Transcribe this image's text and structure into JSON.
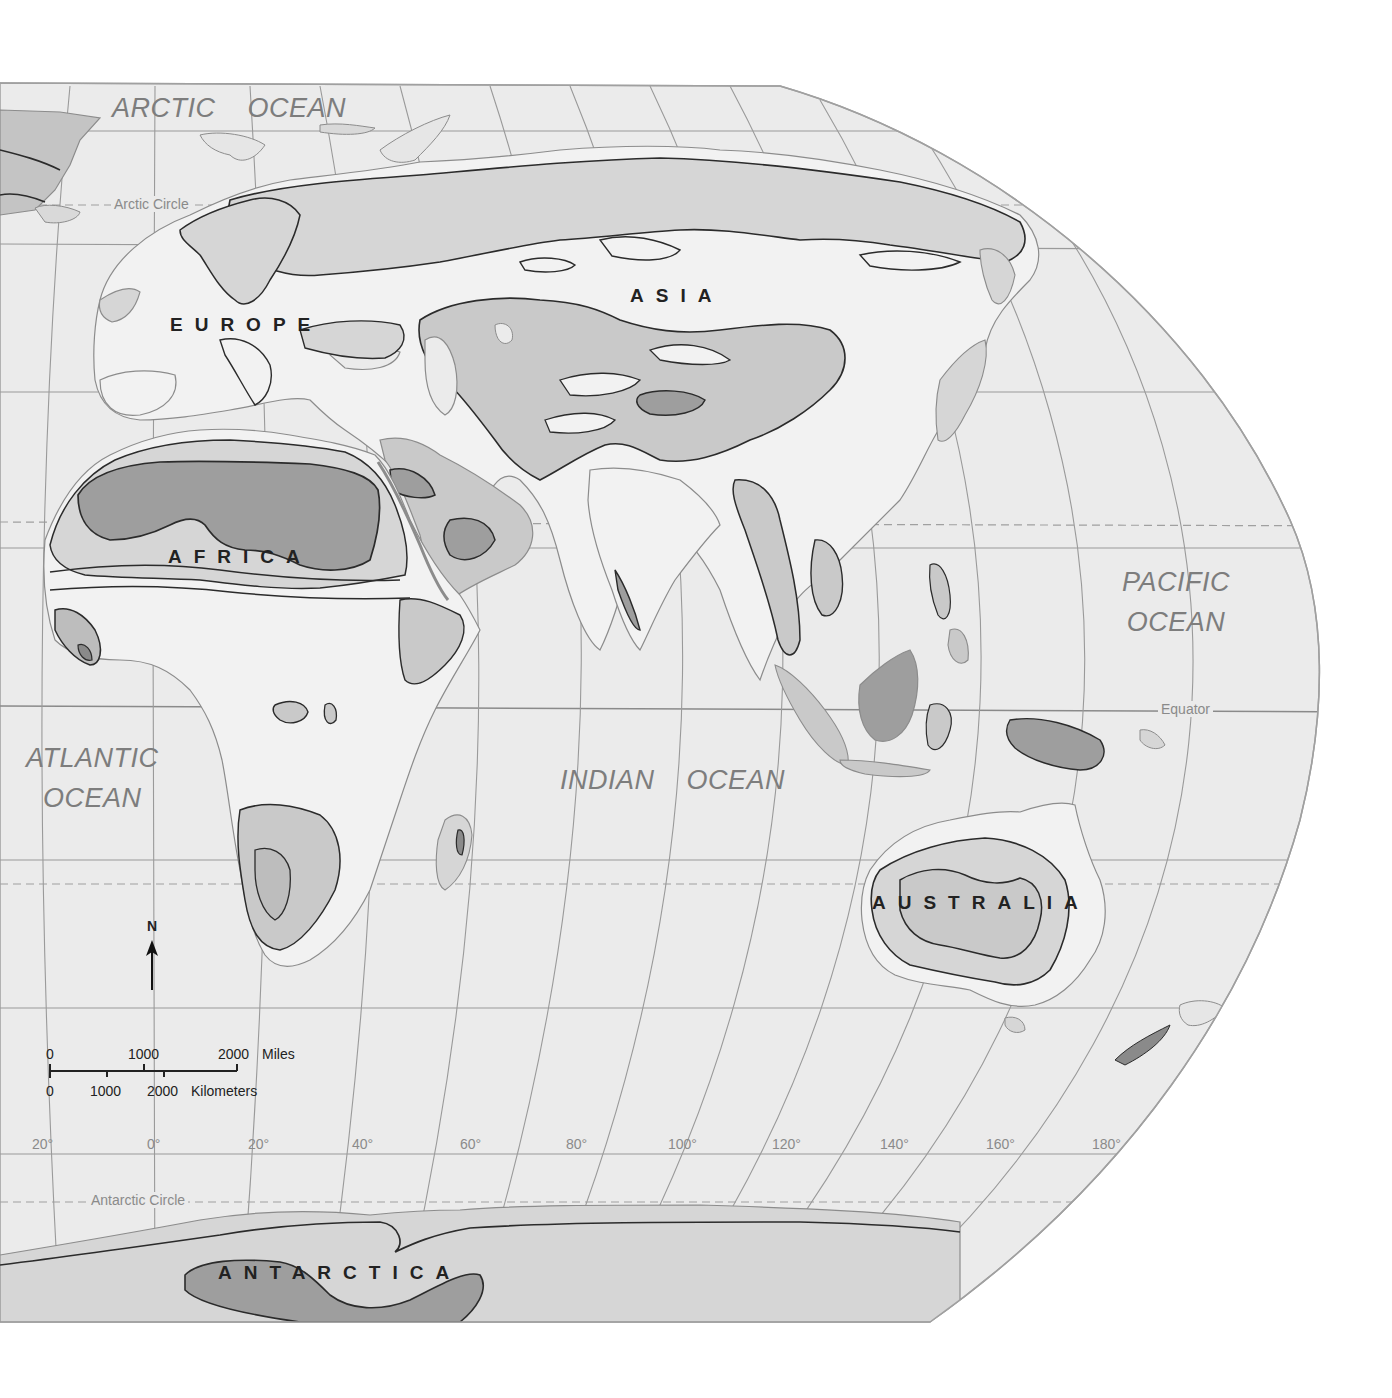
{
  "map": {
    "projection_shape": "half-oval world map (Eastern Hemisphere)",
    "colors": {
      "page_background": "#ffffff",
      "ocean": "#ebebeb",
      "land_lightest": "#f4f4f4",
      "land_light": "#d9d9d9",
      "land_medium": "#bdbdbd",
      "land_dark": "#9a9a9a",
      "contour_line": "#2b2b2b",
      "coast_line": "#8c8c8c",
      "graticule": "#9a9a9a",
      "label_ocean": "#7d7d7d",
      "label_continent": "#222222"
    },
    "oceans": [
      {
        "id": "arctic",
        "lines": [
          "ARCTIC    OCEAN"
        ]
      },
      {
        "id": "atlantic",
        "lines": [
          "ATLANTIC",
          "OCEAN"
        ]
      },
      {
        "id": "indian",
        "lines": [
          "INDIAN    OCEAN"
        ]
      },
      {
        "id": "pacific",
        "lines": [
          "PACIFIC",
          "OCEAN"
        ]
      }
    ],
    "continents": [
      "EUROPE",
      "ASIA",
      "AFRICA",
      "AUSTRALIA",
      "ANTARCTICA"
    ],
    "reference_lines": {
      "arctic_circle": "Arctic Circle",
      "equator": "Equator",
      "antarctic_circle": "Antarctic Circle"
    },
    "longitude_labels": [
      "20°",
      "0°",
      "20°",
      "40°",
      "60°",
      "80°",
      "100°",
      "120°",
      "140°",
      "160°",
      "180°"
    ],
    "north_arrow": {
      "label": "N"
    },
    "scale_bar": {
      "miles": {
        "ticks": [
          "0",
          "1000",
          "2000"
        ],
        "unit": "Miles"
      },
      "kilometers": {
        "ticks": [
          "0",
          "1000",
          "2000"
        ],
        "unit": "Kilometers"
      }
    }
  }
}
